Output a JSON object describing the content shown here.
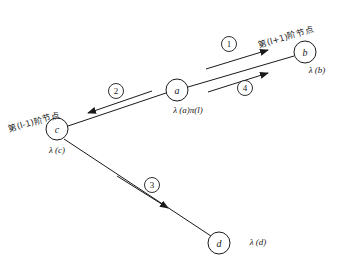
{
  "figure": {
    "background_color": "#ffffff",
    "ink_color": "#1a1a1a"
  },
  "annotations": {
    "upper_right": "第(l+1)阶节点",
    "left": "第(l-1)阶节点"
  },
  "nodes": [
    {
      "id": "a",
      "label": "a",
      "value_label": "λ (a)π(l)",
      "cx": 177,
      "cy": 90,
      "r": 11
    },
    {
      "id": "b",
      "label": "b",
      "value_label": "λ (b)",
      "cx": 305,
      "cy": 52,
      "r": 11
    },
    {
      "id": "c",
      "label": "c",
      "value_label": "λ (c)",
      "cx": 57,
      "cy": 129,
      "r": 11
    },
    {
      "id": "d",
      "label": "d",
      "value_label": "λ (d)",
      "cx": 219,
      "cy": 243,
      "r": 11
    }
  ],
  "node_value_positions": [
    {
      "id": "a",
      "x": 188,
      "y": 110
    },
    {
      "id": "b",
      "x": 317,
      "y": 70
    },
    {
      "id": "c",
      "x": 57,
      "y": 150
    },
    {
      "id": "d",
      "x": 258,
      "y": 242
    }
  ],
  "edges": [
    {
      "from": "c",
      "to": "a",
      "x1": 68,
      "y1": 126,
      "x2": 166,
      "y2": 93
    },
    {
      "from": "a",
      "to": "b",
      "x1": 188,
      "y1": 87,
      "x2": 294,
      "y2": 56
    },
    {
      "from": "c",
      "to": "d",
      "x1": 64,
      "y1": 139,
      "x2": 211,
      "y2": 236
    }
  ],
  "step_arrows": [
    {
      "number": "1",
      "label_x": 229,
      "label_y": 44,
      "x1": 206,
      "y1": 69,
      "x2": 268,
      "y2": 50,
      "direction": "to-b"
    },
    {
      "number": "2",
      "label_x": 116,
      "label_y": 91,
      "x1": 152,
      "y1": 91,
      "x2": 88,
      "y2": 113,
      "direction": "to-c"
    },
    {
      "number": "3",
      "label_x": 152,
      "label_y": 185,
      "x1": 117,
      "y1": 176,
      "x2": 168,
      "y2": 208,
      "direction": "to-d"
    },
    {
      "number": "4",
      "label_x": 245,
      "label_y": 88,
      "x1": 208,
      "y1": 92,
      "x2": 268,
      "y2": 73,
      "direction": "to-b"
    }
  ]
}
